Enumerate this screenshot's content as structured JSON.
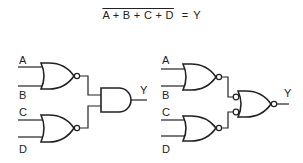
{
  "equation": {
    "lhs": "A + B + C + D",
    "equals": "=",
    "rhs": "Y"
  },
  "left_circuit": {
    "labels": {
      "a": "A",
      "b": "B",
      "c": "C",
      "d": "D",
      "y": "Y"
    },
    "gates": [
      "NOR",
      "NOR",
      "AND"
    ]
  },
  "right_circuit": {
    "labels": {
      "a": "A",
      "b": "B",
      "c": "C",
      "d": "D",
      "y": "Y"
    },
    "gates": [
      "NOR",
      "NOR",
      "NOR with inverted inputs (bubbled)"
    ]
  },
  "colors": {
    "line": "#222222",
    "background": "#ffffff"
  }
}
